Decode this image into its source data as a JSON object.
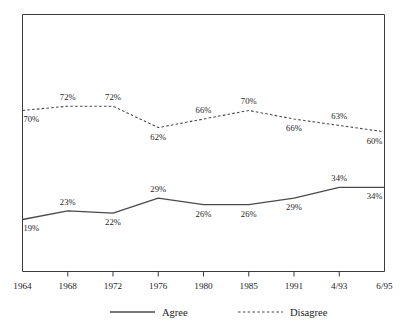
{
  "chart_data": {
    "type": "line",
    "title": "",
    "subtitle": "",
    "xlabel": "",
    "ylabel": "",
    "categories": [
      "1964",
      "1968",
      "1972",
      "1976",
      "1980",
      "1985",
      "1991",
      "4/93",
      "6/95"
    ],
    "ylim": [
      0,
      100
    ],
    "grid": false,
    "y_axis_labels_shown": false,
    "legend_position": "bottom",
    "series": [
      {
        "name": "Agree",
        "style": "solid",
        "values": [
          19,
          23,
          22,
          29,
          26,
          26,
          29,
          34,
          34
        ],
        "point_labels": [
          "19%",
          "23%",
          "22%",
          "29%",
          "26%",
          "26%",
          "29%",
          "34%",
          "34%"
        ],
        "label_placement": [
          "below",
          "above",
          "below",
          "above",
          "below",
          "below",
          "below",
          "above",
          "below"
        ]
      },
      {
        "name": "Disagree",
        "style": "dashed",
        "values": [
          70,
          72,
          72,
          62,
          66,
          70,
          66,
          63,
          60
        ],
        "point_labels": [
          "70%",
          "72%",
          "72%",
          "62%",
          "66%",
          "70%",
          "66%",
          "63%",
          "60%"
        ],
        "label_placement": [
          "below",
          "above",
          "above",
          "below",
          "above",
          "above",
          "below",
          "above",
          "below"
        ]
      }
    ]
  },
  "legend": {
    "items": [
      {
        "label": "Agree",
        "style": "solid"
      },
      {
        "label": "Disagree",
        "style": "dashed"
      }
    ]
  }
}
